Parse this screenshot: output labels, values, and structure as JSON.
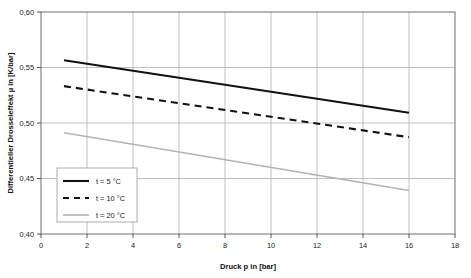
{
  "chart_data": {
    "type": "line",
    "title": "",
    "xlabel": "Druck p in [bar]",
    "ylabel": "Differentieller Drosseleffekt µ in [K/bar]",
    "xlim": [
      0,
      18
    ],
    "ylim": [
      0.4,
      0.6
    ],
    "xticks": [
      0,
      2,
      4,
      6,
      8,
      10,
      12,
      14,
      16,
      18
    ],
    "xtick_labels": [
      "0",
      "2",
      "4",
      "6",
      "8",
      "10",
      "12",
      "14",
      "16",
      "18"
    ],
    "yticks": [
      0.4,
      0.45,
      0.5,
      0.55,
      0.6
    ],
    "ytick_labels": [
      "0,40",
      "0,45",
      "0,50",
      "0,55",
      "0,60"
    ],
    "grid": true,
    "grid_color": "#b0b0b0",
    "frame_color": "#6e6e6e",
    "legend_position": "lower-left-inside",
    "x": [
      1,
      16
    ],
    "series": [
      {
        "name": "t = 5 °C",
        "style": "solid",
        "color": "#111111",
        "width": 2.1,
        "values": [
          0.5565,
          0.5093
        ]
      },
      {
        "name": "t = 10 °C",
        "style": "dashed",
        "color": "#111111",
        "width": 2.1,
        "values": [
          0.5332,
          0.4872
        ]
      },
      {
        "name": "t = 20 °C",
        "style": "solid",
        "color": "#b3b3b3",
        "width": 1.6,
        "values": [
          0.4912,
          0.4392
        ]
      }
    ]
  },
  "legend": {
    "items": [
      {
        "label": "t = 5 °C"
      },
      {
        "label": "t = 10 °C"
      },
      {
        "label": "t = 20 °C"
      }
    ]
  },
  "axes": {
    "x_title": "Druck p in [bar]",
    "y_title": "Differentieller Drosseleffekt µ in [K/bar]",
    "x_labels": [
      "0",
      "2",
      "4",
      "6",
      "8",
      "10",
      "12",
      "14",
      "16",
      "18"
    ],
    "y_labels": [
      "0,60",
      "0,55",
      "0,50",
      "0,45",
      "0,40"
    ]
  },
  "colors": {
    "series_1": "#111111",
    "series_2": "#111111",
    "series_3": "#b3b3b3",
    "grid": "#b0b0b0",
    "frame": "#6e6e6e",
    "background": "#ffffff"
  }
}
